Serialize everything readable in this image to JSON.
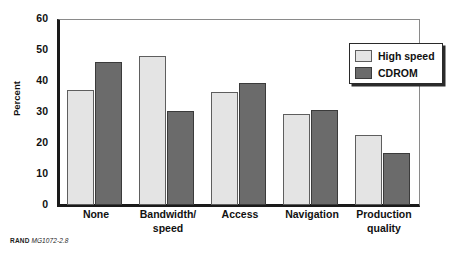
{
  "figure": {
    "source_note_brand": "RAND",
    "source_note_code": "MG1072-2.8"
  },
  "legend": {
    "position": "top-right-inside",
    "entries": [
      {
        "label": "High speed",
        "swatch": "light-gray-swatch",
        "color": "#e4e4e4"
      },
      {
        "label": "CDROM",
        "swatch": "dark-gray-swatch",
        "color": "#6b6b6b"
      }
    ]
  },
  "chart_data": {
    "type": "bar",
    "title": "",
    "subtitle": "",
    "xlabel": "",
    "ylabel": "Percent",
    "ylim": [
      0,
      60
    ],
    "yticks": [
      0,
      10,
      20,
      30,
      40,
      50,
      60
    ],
    "ytick_labels": [
      "0",
      "10",
      "20",
      "30",
      "40",
      "50",
      "60"
    ],
    "grid": false,
    "legend_position": "top right",
    "categories": [
      "None",
      "Bandwidth/ speed",
      "Access",
      "Navigation",
      "Production quality"
    ],
    "category_lines": [
      [
        "None"
      ],
      [
        "Bandwidth/",
        "speed"
      ],
      [
        "Access"
      ],
      [
        "Navigation"
      ],
      [
        "Production",
        "quality"
      ]
    ],
    "series": [
      {
        "name": "High speed",
        "color": "#e4e4e4",
        "values": [
          37.0,
          48.1,
          36.3,
          29.3,
          22.5
        ]
      },
      {
        "name": "CDROM",
        "color": "#6b6b6b",
        "values": [
          46.1,
          30.2,
          39.3,
          30.6,
          16.7
        ]
      }
    ]
  }
}
